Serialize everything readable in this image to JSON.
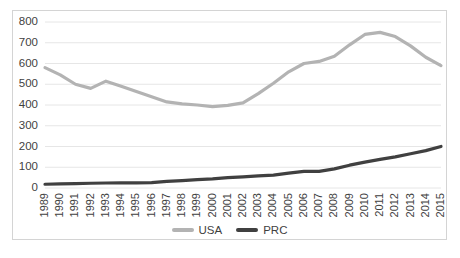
{
  "chart_data": {
    "type": "line",
    "title": "",
    "xlabel": "",
    "ylabel": "",
    "ylim": [
      0,
      800
    ],
    "ytick_step": 100,
    "grid": true,
    "legend_position": "bottom",
    "categories": [
      "1989",
      "1990",
      "1991",
      "1992",
      "1993",
      "1994",
      "1995",
      "1996",
      "1997",
      "1998",
      "1999",
      "2000",
      "2001",
      "2002",
      "2003",
      "2004",
      "2005",
      "2006",
      "2007",
      "2008",
      "2009",
      "2010",
      "2011",
      "2012",
      "2013",
      "2014",
      "2015"
    ],
    "yticks": [
      "0",
      "100",
      "200",
      "300",
      "400",
      "500",
      "600",
      "700",
      "800"
    ],
    "series": [
      {
        "name": "USA",
        "color": "#b3b3b3",
        "values": [
          580,
          545,
          500,
          480,
          515,
          490,
          465,
          440,
          415,
          405,
          400,
          392,
          398,
          410,
          455,
          505,
          560,
          600,
          610,
          635,
          690,
          740,
          750,
          730,
          685,
          630,
          590
        ]
      },
      {
        "name": "PRC",
        "color": "#404040",
        "values": [
          18,
          20,
          21,
          23,
          24,
          25,
          25,
          26,
          32,
          36,
          40,
          44,
          50,
          54,
          58,
          62,
          72,
          80,
          80,
          92,
          110,
          125,
          138,
          150,
          165,
          180,
          200
        ]
      }
    ]
  },
  "legend": {
    "items": [
      {
        "label": "USA",
        "color": "#b3b3b3"
      },
      {
        "label": "PRC",
        "color": "#404040"
      }
    ]
  }
}
